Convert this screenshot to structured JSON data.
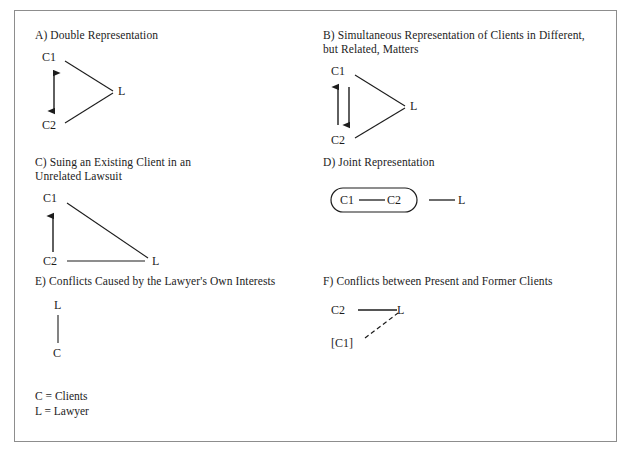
{
  "figure": {
    "border_color": "#8d8d8d",
    "ink_color": "#1c1c1c",
    "background": "#ffffff"
  },
  "panels": [
    {
      "id": "a",
      "label": "A) Double Representation",
      "diagram": {
        "type": "v-triangle",
        "nodes": [
          "C1",
          "C2",
          "L"
        ],
        "edges": [
          {
            "from": "C1",
            "to": "L",
            "style": "solid",
            "arrow": "none"
          },
          {
            "from": "C2",
            "to": "L",
            "style": "solid",
            "arrow": "none"
          },
          {
            "from": "C1",
            "to": "C2",
            "style": "solid",
            "arrow": "double"
          }
        ]
      }
    },
    {
      "id": "b",
      "label": "B) Simultaneous Representation of Clients in Different,\n     but Related, Matters",
      "diagram": {
        "type": "v-triangle",
        "nodes": [
          "C1",
          "C2",
          "L"
        ],
        "edges": [
          {
            "from": "C1",
            "to": "L",
            "style": "solid",
            "arrow": "none"
          },
          {
            "from": "C2",
            "to": "L",
            "style": "solid",
            "arrow": "none"
          },
          {
            "from": "C2",
            "to": "C1",
            "style": "solid",
            "arrow": "up"
          },
          {
            "from": "C1",
            "to": "C2",
            "style": "solid",
            "arrow": "down"
          }
        ]
      }
    },
    {
      "id": "c",
      "label": "C) Suing an Existing Client in an\n     Unrelated Lawsuit",
      "diagram": {
        "type": "right-triangle",
        "nodes": [
          "C1",
          "C2",
          "L"
        ],
        "edges": [
          {
            "from": "C1",
            "to": "L",
            "style": "solid",
            "arrow": "none"
          },
          {
            "from": "C2",
            "to": "L",
            "style": "solid",
            "arrow": "none"
          },
          {
            "from": "C2",
            "to": "C1",
            "style": "solid",
            "arrow": "up"
          }
        ]
      }
    },
    {
      "id": "d",
      "label": "D) Joint Representation",
      "diagram": {
        "type": "grouped-pair",
        "nodes": [
          "C1",
          "C2",
          "L"
        ],
        "group": [
          "C1",
          "C2"
        ],
        "edges": [
          {
            "from": "C1",
            "to": "C2",
            "style": "solid",
            "arrow": "none"
          },
          {
            "from": "C2",
            "to": "L",
            "style": "solid",
            "arrow": "none"
          }
        ]
      }
    },
    {
      "id": "e",
      "label": "E) Conflicts Caused by the Lawyer's Own Interests",
      "diagram": {
        "type": "vertical-pair",
        "nodes": [
          "L",
          "C"
        ],
        "edges": [
          {
            "from": "L",
            "to": "C",
            "style": "solid",
            "arrow": "none"
          }
        ]
      }
    },
    {
      "id": "f",
      "label": "F) Conflicts between Present and Former Clients",
      "diagram": {
        "type": "former-client",
        "nodes": [
          "C2",
          "L",
          "[C1]"
        ],
        "edges": [
          {
            "from": "C2",
            "to": "L",
            "style": "solid",
            "arrow": "none"
          },
          {
            "from": "[C1]",
            "to": "L",
            "style": "dashed",
            "arrow": "none"
          }
        ]
      }
    }
  ],
  "legend": {
    "lines": [
      "C = Clients",
      "L = Lawyer"
    ]
  }
}
